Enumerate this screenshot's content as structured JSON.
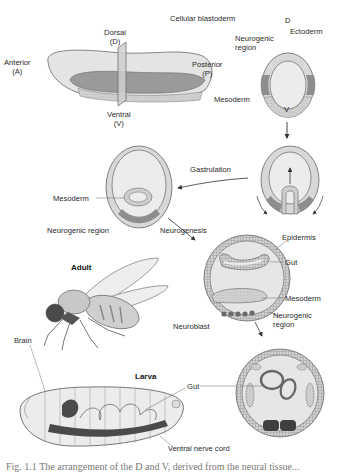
{
  "figure": {
    "stages": {
      "embryo_axes": {
        "dorsal": "Dorsal",
        "dorsal_abbr": "(D)",
        "ventral": "Ventral",
        "ventral_abbr": "(V)",
        "anterior": "Anterior",
        "anterior_abbr": "(A)",
        "posterior": "Posterior",
        "posterior_abbr": "(P)"
      },
      "cellular_blastoderm": {
        "title": "Cellular blastoderm",
        "d": "D",
        "v": "V",
        "ectoderm": "Ectoderm",
        "neurogenic_region_1": "Neurogenic",
        "neurogenic_region_2": "region",
        "mesoderm": "Mesoderm"
      },
      "gastrulation": {
        "process": "Gastrulation",
        "mesoderm": "Mesoderm",
        "neurogenic_region": "Neurogenic region"
      },
      "neurogenesis": {
        "process": "Neurogenesis",
        "epidermis": "Epidermis",
        "gut": "Gut",
        "mesoderm": "Mesoderm",
        "neurogenic_region_1": "Neurogenic",
        "neurogenic_region_2": "region",
        "neuroblast": "Neuroblast"
      },
      "adult": {
        "title": "Adult",
        "brain": "Brain"
      },
      "larva": {
        "title": "Larva",
        "gut": "Gut",
        "ventral_nerve_cord": "Ventral nerve cord"
      }
    },
    "caption": "Fig. 1.1  The arrangement of the D and V, derived from the neural tissue..."
  },
  "colors": {
    "light_gray": "#e2e2e2",
    "mid_gray": "#c9c9c9",
    "dark_gray": "#8a8a8a",
    "nerve_cord": "#4a4a4a",
    "outline": "#6a6a6a"
  }
}
